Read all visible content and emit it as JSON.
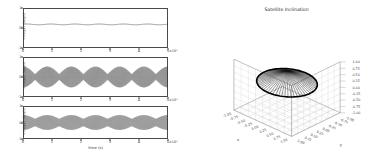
{
  "figure": {
    "background": "#ffffff",
    "line_color": "#3a3a3a"
  },
  "chart_data": [
    {
      "type": "line",
      "name": "omega1-timeseries",
      "title": "",
      "xlabel": "",
      "ylabel": "omega1 (deg/s)",
      "x_exponent": "×10⁴",
      "xlim": [
        0,
        5
      ],
      "ylim": [
        -1,
        1
      ],
      "xticks": [
        "0",
        "1",
        "2",
        "3",
        "4",
        "5"
      ],
      "yticks": [
        "1",
        "0",
        "-1"
      ],
      "grid": false,
      "description": "Near-constant slightly positive value with very small ripple",
      "series": [
        {
          "name": "omega1",
          "mean": 0.18,
          "ripple_amplitude": 0.02,
          "ripple_cycles": 6
        }
      ]
    },
    {
      "type": "line",
      "name": "omega2-timeseries",
      "title": "",
      "xlabel": "",
      "ylabel": "omega2 (deg/s)",
      "x_exponent": "×10⁴",
      "xlim": [
        0,
        5
      ],
      "ylim": [
        -1,
        1
      ],
      "xticks": [
        "0",
        "1",
        "2",
        "3",
        "4",
        "5"
      ],
      "yticks": [
        "1",
        "0",
        "-1"
      ],
      "grid": false,
      "description": "High-frequency oscillation with beating envelope, 6 beat nodes",
      "series": [
        {
          "name": "omega2",
          "carrier_cycles": 150,
          "envelope_cycles": 6,
          "envelope_max": 0.52,
          "envelope_min": 0.14
        }
      ]
    },
    {
      "type": "line",
      "name": "omega3-timeseries",
      "title": "",
      "xlabel": "time (s)",
      "ylabel": "omega3 (deg/s)",
      "x_exponent": "×10⁴",
      "xlim": [
        0,
        5
      ],
      "ylim": [
        -1,
        1
      ],
      "xticks": [
        "0",
        "1",
        "2",
        "3",
        "4",
        "5"
      ],
      "yticks": [
        "1",
        "0",
        "-1"
      ],
      "grid": false,
      "description": "High-frequency oscillation with shallower beating envelope",
      "series": [
        {
          "name": "omega3",
          "carrier_cycles": 150,
          "envelope_cycles": 6,
          "envelope_max": 0.45,
          "envelope_min": 0.22
        }
      ]
    },
    {
      "type": "scatter",
      "name": "satellite-inclination-3d",
      "title": "Satellite Inclination",
      "projection": "3d",
      "xlabel": "x",
      "ylabel": "y",
      "zlabel": "",
      "xlim": [
        -1.0,
        1.0
      ],
      "ylim": [
        -1.0,
        1.0
      ],
      "zlim": [
        -1.0,
        1.0
      ],
      "xticks": [
        "-1.00",
        "-0.75",
        "-0.50",
        "-0.25",
        "0.00",
        "0.25",
        "0.50",
        "0.75",
        "1.00"
      ],
      "yticks": [
        "-1.00",
        "-0.75",
        "-0.50",
        "-0.25",
        "0.00",
        "0.25",
        "0.50",
        "0.75",
        "1.00"
      ],
      "zticks": [
        "1.00",
        "0.75",
        "0.50",
        "0.25",
        "0.00",
        "-0.25",
        "-0.50",
        "-0.75",
        "-1.00"
      ],
      "grid": true,
      "description": "Cone of orbit-normal vectors radiating from a common apex, forming a filled circular fan (inclination cone)",
      "series": [
        {
          "name": "inclination-vectors",
          "vector_count": 60,
          "apex": [
            0.0,
            0.0,
            0.62
          ],
          "cone_half_angle_deg": 52,
          "color": "#1a1a1a"
        }
      ]
    }
  ]
}
